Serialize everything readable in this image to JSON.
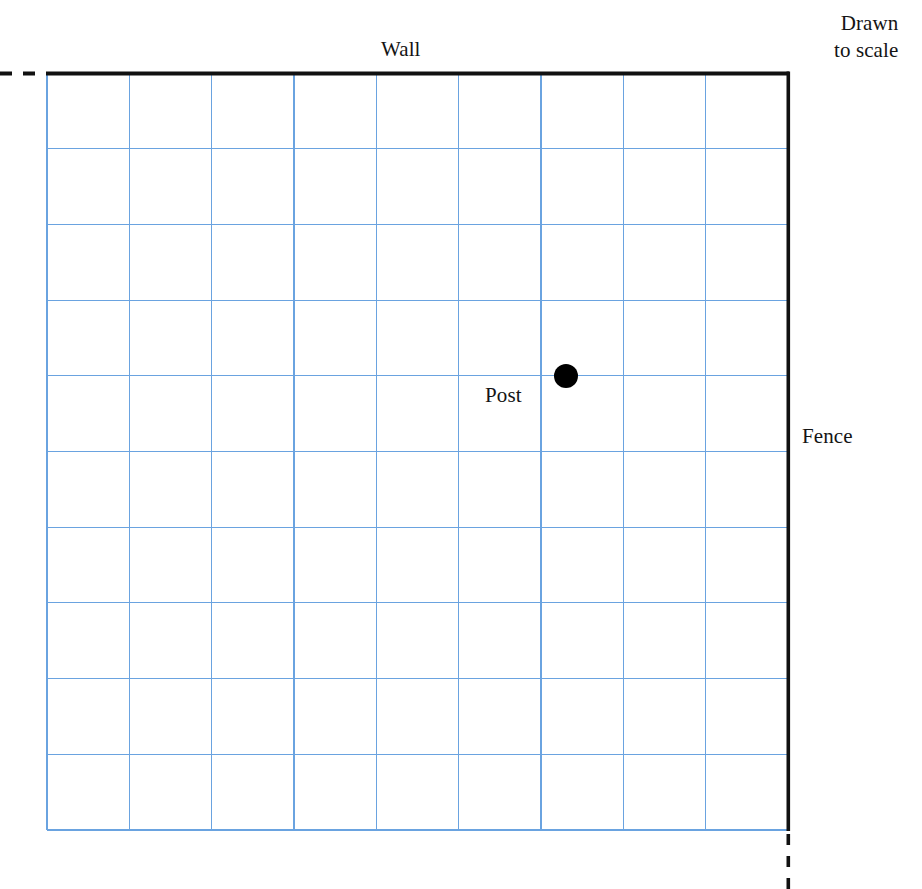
{
  "diagram": {
    "title_labels": {
      "wall": "Wall",
      "fence": "Fence",
      "post": "Post"
    },
    "scale_note": {
      "line1": "Drawn",
      "line2": "to scale"
    },
    "colors": {
      "grid_line": "#6aa3e0",
      "boundary_line": "#111111",
      "post_fill": "#000000",
      "background": "#ffffff"
    }
  },
  "chart_data": {
    "type": "diagram",
    "grid": {
      "columns": 9,
      "rows": 10,
      "cell_width_px": 82.3,
      "cell_height_px": 75.7,
      "x_left_px": 47,
      "x_right_px": 788,
      "y_top_px": 73,
      "y_bottom_px": 830,
      "line_color": "#6aa3e0",
      "grid_on": true
    },
    "boundaries": [
      {
        "name": "Wall",
        "orientation": "horizontal",
        "solid_from_px": [
          47,
          73
        ],
        "solid_to_px": [
          788,
          73
        ],
        "dashed_extension": "left",
        "dash_count": 3,
        "label": "Wall"
      },
      {
        "name": "Fence",
        "orientation": "vertical",
        "solid_from_px": [
          788,
          73
        ],
        "solid_to_px": [
          788,
          830
        ],
        "dashed_extension": "down",
        "dash_count": 4,
        "label": "Fence"
      }
    ],
    "points": [
      {
        "label": "Post",
        "x_px": 566,
        "y_px": 376,
        "grid_col": 6,
        "grid_row": 4,
        "radius_px": 12,
        "fill": "#000000",
        "label_position": "below-left"
      }
    ],
    "annotations": [
      {
        "text": "Drawn to scale",
        "position": "top-right"
      }
    ]
  }
}
